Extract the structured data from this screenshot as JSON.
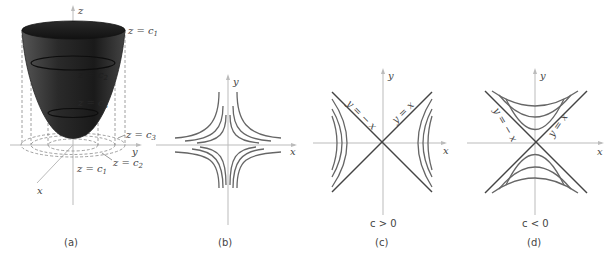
{
  "panels": [
    {
      "id": "a",
      "caption": "(a)",
      "type": "paraboloid-3d",
      "axes": {
        "z": "z",
        "y": "y",
        "x": "x"
      },
      "surface_labels": [
        "z = c1",
        "z = c2",
        "z = c3"
      ],
      "contour_labels": [
        "z = c3",
        "z = c2",
        "z = c1"
      ],
      "label_text": {
        "top": "z = c",
        "top_sub": "1",
        "mid1": "z = c",
        "mid1_sub": "2",
        "mid2": "z = c",
        "mid2_sub": "3",
        "ring3": "z = c",
        "ring3_sub": "3",
        "ring2": "z = c",
        "ring2_sub": "2",
        "ring1": "z = c",
        "ring1_sub": "1"
      }
    },
    {
      "id": "b",
      "caption": "(b)",
      "type": "level-curves-xy",
      "axes": {
        "x": "x",
        "y": "y"
      }
    },
    {
      "id": "c",
      "caption": "(c)",
      "type": "hyperbolas-left-right",
      "axes": {
        "x": "x",
        "y": "y"
      },
      "asymptote_labels": {
        "neg": "y = − x",
        "pos": "y = x"
      },
      "condition": "c > 0"
    },
    {
      "id": "d",
      "caption": "(d)",
      "type": "hyperbolas-up-down",
      "axes": {
        "x": "x",
        "y": "y"
      },
      "asymptote_labels": {
        "neg": "y = − x",
        "pos": "y = x"
      },
      "condition": "c < 0"
    }
  ],
  "colors": {
    "surface_dark": "#1a1a1a",
    "surface_mid": "#555555",
    "curve": "#666666",
    "axis": "#bbbbbb"
  }
}
